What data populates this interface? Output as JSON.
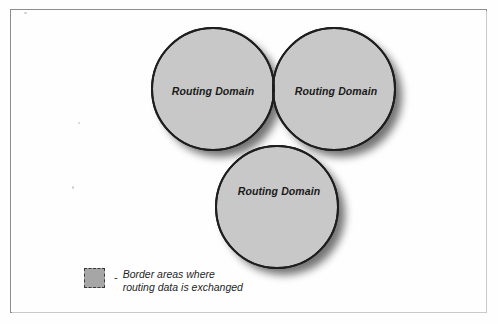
{
  "figure": {
    "type": "venn-diagram",
    "circle_count": 3,
    "frame_visible": true
  },
  "colors": {
    "circle_fill": "#c8c8c8",
    "circle_stroke": "#1e1e1e",
    "overlap_fill": "#9a9a9a",
    "overlap_stroke": "#2b2b2b",
    "shadow": "#8a8a8a",
    "frame": "#8d8d8d",
    "background": "#fefefe",
    "text": "#1a1a1a"
  },
  "circles": [
    {
      "id": "left",
      "label": "Routing Domain",
      "cx": 213,
      "cy": 89,
      "r": 61,
      "label_x": 213,
      "label_y": 91
    },
    {
      "id": "right",
      "label": "Routing Domain",
      "cx": 334,
      "cy": 89,
      "r": 61,
      "label_x": 336,
      "label_y": 91
    },
    {
      "id": "bottom",
      "label": "Routing Domain",
      "cx": 277,
      "cy": 207,
      "r": 61,
      "label_x": 279,
      "label_y": 191
    }
  ],
  "overlaps": [
    {
      "id": "left-right",
      "description": "Border area where routing data is exchanged"
    },
    {
      "id": "left-bottom",
      "description": "Border area where routing data is exchanged"
    },
    {
      "id": "right-bottom",
      "description": "Border area where routing data is exchanged"
    }
  ],
  "legend": {
    "swatch": "dashed-gray-square",
    "separator": "-",
    "line1": "Border areas where",
    "line2": "routing data is exchanged"
  }
}
